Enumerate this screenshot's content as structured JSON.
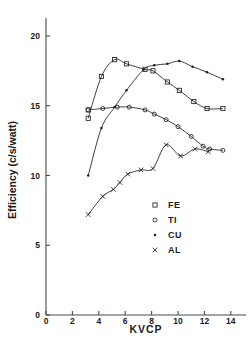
{
  "chart_data": {
    "type": "scatter",
    "title": "",
    "xlabel": "KVCP",
    "ylabel": "Efficiency (c/s/watt)",
    "xlim": [
      0,
      15
    ],
    "ylim": [
      0,
      21
    ],
    "xticks": [
      0,
      2,
      4,
      6,
      8,
      10,
      12,
      14
    ],
    "yticks": [
      0,
      5,
      10,
      15,
      20
    ],
    "xtick_labels": [
      "0",
      "2",
      "4",
      "6",
      "8",
      "10",
      "12",
      "14"
    ],
    "ytick_labels": [
      "0",
      "5",
      "10",
      "15",
      "20"
    ],
    "grid": false,
    "legend_position": "center-right-lower",
    "series": [
      {
        "name": "FE",
        "marker": "open-square",
        "points": [
          [
            3.2,
            14.1
          ],
          [
            3.2,
            14.7
          ],
          [
            4.2,
            17.1
          ],
          [
            5.2,
            18.3
          ],
          [
            6.1,
            18.0
          ],
          [
            7.5,
            17.6
          ],
          [
            8.1,
            17.5
          ],
          [
            9.2,
            16.7
          ],
          [
            10.1,
            16.1
          ],
          [
            11.2,
            15.3
          ],
          [
            12.2,
            14.8
          ],
          [
            13.4,
            14.8
          ]
        ]
      },
      {
        "name": "TI",
        "marker": "open-circle",
        "points": [
          [
            3.2,
            14.7
          ],
          [
            4.3,
            14.8
          ],
          [
            5.4,
            14.9
          ],
          [
            6.3,
            14.9
          ],
          [
            7.5,
            14.7
          ],
          [
            8.2,
            14.4
          ],
          [
            9.1,
            14.0
          ],
          [
            10.0,
            13.5
          ],
          [
            11.0,
            12.8
          ],
          [
            11.9,
            12.1
          ],
          [
            12.4,
            11.9
          ],
          [
            13.4,
            11.8
          ]
        ]
      },
      {
        "name": "CU",
        "marker": "filled-dot",
        "points": [
          [
            3.2,
            10.0
          ],
          [
            4.2,
            13.4
          ],
          [
            5.2,
            14.9
          ],
          [
            6.1,
            16.1
          ],
          [
            7.4,
            17.6
          ],
          [
            8.2,
            17.9
          ],
          [
            9.2,
            18.0
          ],
          [
            10.1,
            18.2
          ],
          [
            11.1,
            17.8
          ],
          [
            12.2,
            17.4
          ],
          [
            13.4,
            16.9
          ]
        ]
      },
      {
        "name": "AL",
        "marker": "cross-x",
        "points": [
          [
            3.2,
            7.2
          ],
          [
            4.3,
            8.5
          ],
          [
            5.1,
            9.0
          ],
          [
            5.6,
            9.5
          ],
          [
            6.2,
            10.1
          ],
          [
            7.2,
            10.4
          ],
          [
            8.1,
            10.5
          ],
          [
            9.1,
            12.2
          ],
          [
            10.2,
            11.4
          ],
          [
            11.3,
            11.9
          ],
          [
            12.3,
            11.7
          ]
        ]
      }
    ],
    "legend_entries": [
      {
        "label": "FE",
        "marker": "open-square"
      },
      {
        "label": "TI",
        "marker": "open-circle"
      },
      {
        "label": "CU",
        "marker": "filled-dot"
      },
      {
        "label": "AL",
        "marker": "cross-x"
      }
    ]
  },
  "footer": {
    "scan_artifact_text": ""
  }
}
